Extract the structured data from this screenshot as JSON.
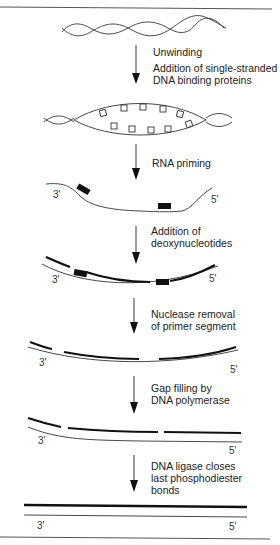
{
  "diagram": {
    "title": "",
    "steps": [
      {
        "id": "unwinding",
        "lines": [
          "Unwinding"
        ]
      },
      {
        "id": "ssb",
        "lines": [
          "Addition of single-stranded",
          "DNA binding proteins"
        ]
      },
      {
        "id": "priming",
        "lines": [
          "RNA priming"
        ]
      },
      {
        "id": "elongation",
        "lines": [
          "Addition of",
          "deoxynucleotides"
        ]
      },
      {
        "id": "nuclease",
        "lines": [
          "Nuclease removal",
          "of primer segment"
        ]
      },
      {
        "id": "gapfill",
        "lines": [
          "Gap filling by",
          "DNA polymerase"
        ]
      },
      {
        "id": "ligase",
        "lines": [
          "DNA ligase closes",
          "last phosphodiester",
          "bonds"
        ]
      }
    ],
    "ends": {
      "three_prime": "3'",
      "five_prime": "5'"
    }
  }
}
